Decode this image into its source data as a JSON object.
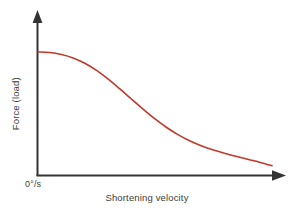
{
  "chart_data": {
    "type": "line",
    "title": "",
    "subtitle": "",
    "xlabel": "Shortening velocity",
    "ylabel": "Force (load)",
    "origin_tick_label": "0°/s",
    "grid": false,
    "legend": null,
    "axis_color": "#333333",
    "series": [
      {
        "name": "force-velocity-curve",
        "color": "#c0392b",
        "line_width": 1.6,
        "x": [
          0.0,
          0.05,
          0.1,
          0.15,
          0.2,
          0.25,
          0.3,
          0.35,
          0.4,
          0.45,
          0.5,
          0.55,
          0.6,
          0.65,
          0.7,
          0.75,
          0.8,
          0.85,
          0.9,
          0.95,
          1.0
        ],
        "y": [
          1.0,
          0.996,
          0.98,
          0.952,
          0.908,
          0.85,
          0.78,
          0.7,
          0.616,
          0.534,
          0.456,
          0.386,
          0.326,
          0.276,
          0.236,
          0.203,
          0.175,
          0.15,
          0.126,
          0.102,
          0.075
        ]
      }
    ],
    "xlim": [
      0,
      1
    ],
    "ylim": [
      0,
      1
    ],
    "x_ticks": [],
    "y_ticks": [],
    "annotations": []
  },
  "axes": {
    "y_arrow": true,
    "x_arrow": true
  }
}
